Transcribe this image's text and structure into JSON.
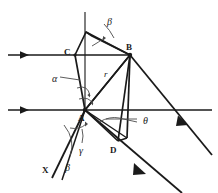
{
  "figure": {
    "type": "optics-ray-diagram",
    "background_color": "#ffffff",
    "stroke_color": "#1a1a1a",
    "thin_stroke_color": "#4a4a4a",
    "point_labels": [
      {
        "name": "A",
        "text": "A",
        "x": 78,
        "y": 114
      },
      {
        "name": "B",
        "text": "B",
        "x": 126,
        "y": 43
      },
      {
        "name": "C",
        "text": "C",
        "x": 64,
        "y": 48
      },
      {
        "name": "D",
        "text": "D",
        "x": 110,
        "y": 146
      },
      {
        "name": "X",
        "text": "X",
        "x": 42,
        "y": 166
      }
    ],
    "angle_labels": [
      {
        "name": "beta-top",
        "text": "β",
        "x": 107,
        "y": 17
      },
      {
        "name": "alpha",
        "text": "α",
        "x": 52,
        "y": 74
      },
      {
        "name": "refraction-r",
        "text": "r",
        "x": 104,
        "y": 70
      },
      {
        "name": "theta",
        "text": "θ",
        "x": 143,
        "y": 116
      },
      {
        "name": "gamma",
        "text": "γ",
        "x": 79,
        "y": 146
      },
      {
        "name": "beta-bottom",
        "text": "β",
        "x": 65,
        "y": 163
      }
    ],
    "geometry": {
      "vertex_A": [
        85,
        110
      ],
      "vertex_B": [
        130,
        55
      ],
      "vertex_C": [
        75,
        55
      ],
      "vertex_D": [
        118,
        141
      ],
      "apex_top": [
        86,
        32
      ],
      "normal_axis_top": [
        85,
        12
      ],
      "upper_ray_y": 55,
      "lower_ray_y": 110,
      "ray_left_start_x": 8,
      "ray_right_end_x": 212
    },
    "legend_notes": []
  }
}
